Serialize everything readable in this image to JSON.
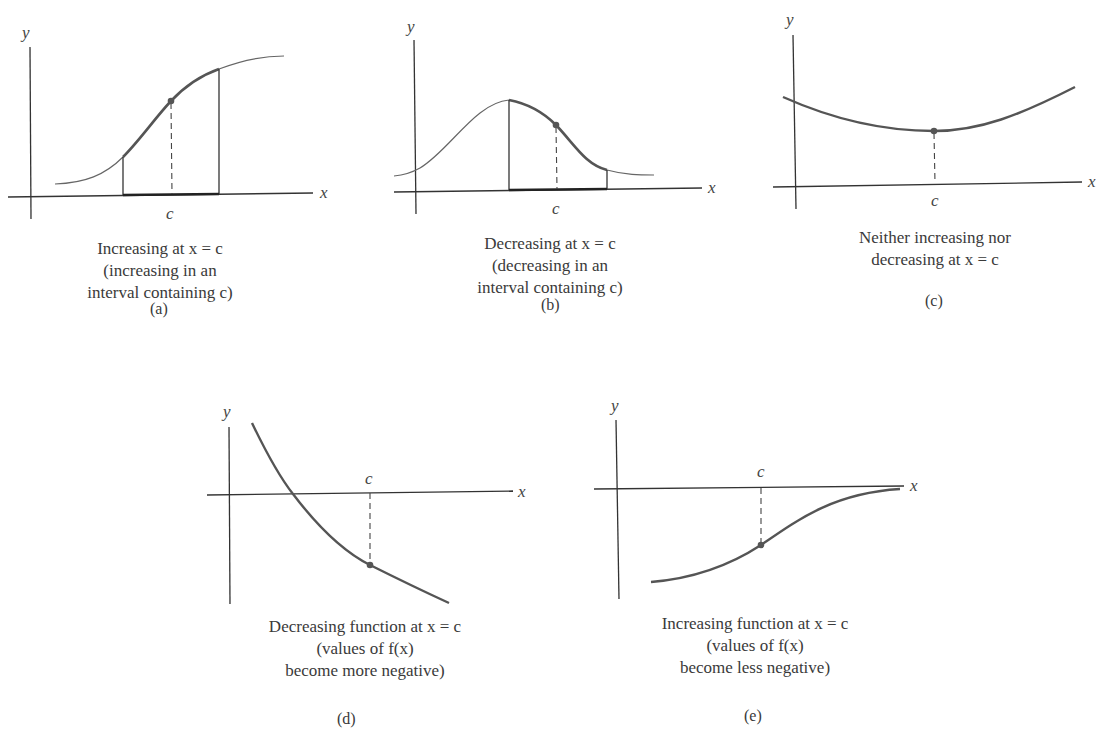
{
  "figure": {
    "panels": [
      {
        "id": "a",
        "tag": "(a)",
        "caption": [
          "Increasing at x = c",
          "(increasing in an",
          "interval containing c)"
        ],
        "axis_labels": {
          "x": "x",
          "y": "y",
          "point": "c"
        }
      },
      {
        "id": "b",
        "tag": "(b)",
        "caption": [
          "Decreasing at x = c",
          "(decreasing in an",
          "interval containing c)"
        ],
        "axis_labels": {
          "x": "x",
          "y": "y",
          "point": "c"
        }
      },
      {
        "id": "c",
        "tag": "(c)",
        "caption": [
          "Neither increasing nor",
          "decreasing at x = c"
        ],
        "axis_labels": {
          "x": "x",
          "y": "y",
          "point": "c"
        }
      },
      {
        "id": "d",
        "tag": "(d)",
        "caption": [
          "Decreasing function at x = c",
          "(values of f(x)",
          "become more negative)"
        ],
        "axis_labels": {
          "x": "x",
          "y": "y",
          "point": "c"
        }
      },
      {
        "id": "e",
        "tag": "(e)",
        "caption": [
          "Increasing function at x = c",
          "(values of f(x)",
          "become less negative)"
        ],
        "axis_labels": {
          "x": "x",
          "y": "y",
          "point": "c"
        }
      }
    ],
    "colors": {
      "curve": "#555555",
      "axis": "#333333",
      "point": "#555555",
      "text": "#3a3a3a"
    }
  }
}
